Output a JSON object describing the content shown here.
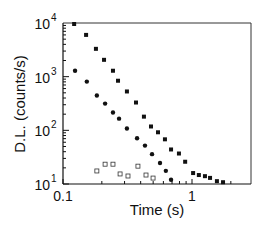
{
  "chart_data": {
    "type": "scatter",
    "title": "",
    "xlabel": "Time (s)",
    "ylabel": "D.L. (counts/s)",
    "xscale": "log",
    "yscale": "log",
    "xlim": [
      0.1,
      2.2
    ],
    "ylim": [
      10,
      10000
    ],
    "x_ticks": [
      {
        "value": 0.1,
        "label": "0.1"
      },
      {
        "value": 1,
        "label": "1"
      }
    ],
    "y_ticks": [
      {
        "value": 10,
        "base": "10",
        "exp": "1"
      },
      {
        "value": 100,
        "base": "10",
        "exp": "2"
      },
      {
        "value": 1000,
        "base": "10",
        "exp": "3"
      },
      {
        "value": 10000,
        "base": "10",
        "exp": "4"
      }
    ],
    "grid": false,
    "legend": null,
    "series": [
      {
        "name": "upper (filled squares)",
        "marker": "filled-square",
        "x": [
          0.122,
          0.151,
          0.18,
          0.208,
          0.244,
          0.267,
          0.313,
          0.368,
          0.424,
          0.481,
          0.545,
          0.617,
          0.688,
          0.792,
          0.885,
          1.02,
          1.13,
          1.26,
          1.38,
          1.56,
          1.74
        ],
        "y": [
          9580,
          6000,
          3300,
          2060,
          1290,
          840,
          530,
          330,
          180,
          118,
          92,
          68,
          44,
          37,
          26,
          16,
          14.7,
          14,
          13,
          11.3,
          10.8
        ]
      },
      {
        "name": "lower (filled circles)",
        "marker": "filled-circle",
        "x": [
          0.124,
          0.153,
          0.183,
          0.212,
          0.244,
          0.272,
          0.313,
          0.375,
          0.432,
          0.49,
          0.565,
          0.627,
          0.688
        ],
        "y": [
          1290,
          810,
          445,
          315,
          215,
          165,
          108,
          71,
          52,
          36,
          24.6,
          17.6,
          12
        ]
      },
      {
        "name": "background (open squares)",
        "marker": "open-square",
        "x": [
          0.183,
          0.212,
          0.244,
          0.277,
          0.319,
          0.381,
          0.44,
          0.499
        ],
        "y": [
          17.5,
          23.4,
          23.4,
          15.4,
          14.1,
          21.5,
          14.7,
          12.9
        ]
      }
    ]
  }
}
